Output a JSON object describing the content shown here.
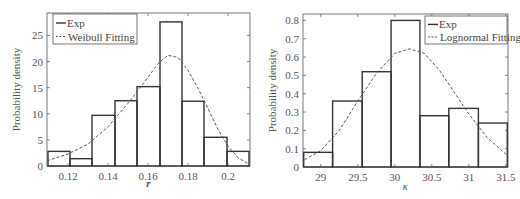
{
  "chart_data": [
    {
      "type": "bar",
      "subtype": "histogram-with-fit",
      "title": "",
      "xlabel": "r",
      "ylabel": "Probability density",
      "xlim": [
        0.1095,
        0.211
      ],
      "ylim": [
        0,
        29.3
      ],
      "xticks": [
        0.12,
        0.14,
        0.16,
        0.18,
        0.2
      ],
      "xtick_labels": [
        "0.12",
        "0.14",
        "0.16",
        "0.18",
        "0.2"
      ],
      "yticks": [
        0,
        5,
        10,
        15,
        20,
        25
      ],
      "ytick_labels": [
        "0",
        "5",
        "10",
        "15",
        "20",
        "25"
      ],
      "grid": false,
      "legend": {
        "position": "upper left",
        "entries": [
          "Exp",
          "Weibull Fitting"
        ]
      },
      "bin_edges": [
        0.11,
        0.121,
        0.132,
        0.1435,
        0.1545,
        0.166,
        0.177,
        0.188,
        0.1995,
        0.2105
      ],
      "series": [
        {
          "name": "Exp",
          "style": "histogram",
          "values": [
            2.8,
            1.4,
            9.7,
            12.5,
            15.2,
            27.6,
            12.4,
            5.5,
            2.8
          ]
        },
        {
          "name": "Weibull Fitting",
          "style": "dashed-line",
          "x": [
            0.1095,
            0.12,
            0.13,
            0.14,
            0.15,
            0.16,
            0.165,
            0.17,
            0.175,
            0.18,
            0.185,
            0.19,
            0.195,
            0.2,
            0.205,
            0.2105
          ],
          "y": [
            1.0,
            2.3,
            4.2,
            7.5,
            12.0,
            17.0,
            19.6,
            21.2,
            20.8,
            18.3,
            14.9,
            11.0,
            7.0,
            3.8,
            1.6,
            0.3
          ]
        }
      ]
    },
    {
      "type": "bar",
      "subtype": "histogram-with-fit",
      "title": "",
      "xlabel": "κ",
      "ylabel": "Probability density",
      "xlim": [
        28.76,
        31.53
      ],
      "ylim": [
        0,
        0.835
      ],
      "xticks": [
        29,
        29.5,
        30,
        30.5,
        31,
        31.5
      ],
      "xtick_labels": [
        "29",
        "29.5",
        "30",
        "30.5",
        "31",
        "31.5"
      ],
      "yticks": [
        0,
        0.1,
        0.2,
        0.3,
        0.4,
        0.5,
        0.6,
        0.7,
        0.8
      ],
      "ytick_labels": [
        "0",
        "0.1",
        "0.2",
        "0.3",
        "0.4",
        "0.5",
        "0.6",
        "0.7",
        "0.8"
      ],
      "grid": false,
      "legend": {
        "position": "upper right",
        "entries": [
          "Exp",
          "Lognormal Fitting"
        ]
      },
      "bin_edges": [
        28.77,
        29.16,
        29.56,
        29.95,
        30.34,
        30.73,
        31.13,
        31.52
      ],
      "series": [
        {
          "name": "Exp",
          "style": "histogram",
          "values": [
            0.08,
            0.36,
            0.52,
            0.8,
            0.28,
            0.32,
            0.24
          ]
        },
        {
          "name": "Lognormal Fitting",
          "style": "dashed-line",
          "x": [
            28.78,
            29.0,
            29.25,
            29.5,
            29.75,
            30.0,
            30.2,
            30.4,
            30.6,
            30.8,
            31.0,
            31.25,
            31.53
          ],
          "y": [
            0.04,
            0.09,
            0.2,
            0.36,
            0.51,
            0.62,
            0.645,
            0.62,
            0.53,
            0.41,
            0.29,
            0.16,
            0.06
          ]
        }
      ]
    }
  ],
  "layout": [
    {
      "box": {
        "x0": 47,
        "y0": 13,
        "x1": 250,
        "y1": 166
      },
      "legend_box": {
        "x": 53,
        "y": 14,
        "w": 84,
        "h": 30
      },
      "ylabel_x": 20,
      "xlabel_y": 187
    },
    {
      "box": {
        "x0": 303,
        "y0": 14,
        "x1": 508,
        "y1": 167
      },
      "legend_box": {
        "x": 425,
        "y": 16,
        "w": 82,
        "h": 28
      },
      "ylabel_x": 276,
      "xlabel_y": 190
    }
  ],
  "colors": {
    "bar_stroke": "#333333",
    "axis": "#555555",
    "fit_line": "#555555",
    "text": "#555555"
  }
}
